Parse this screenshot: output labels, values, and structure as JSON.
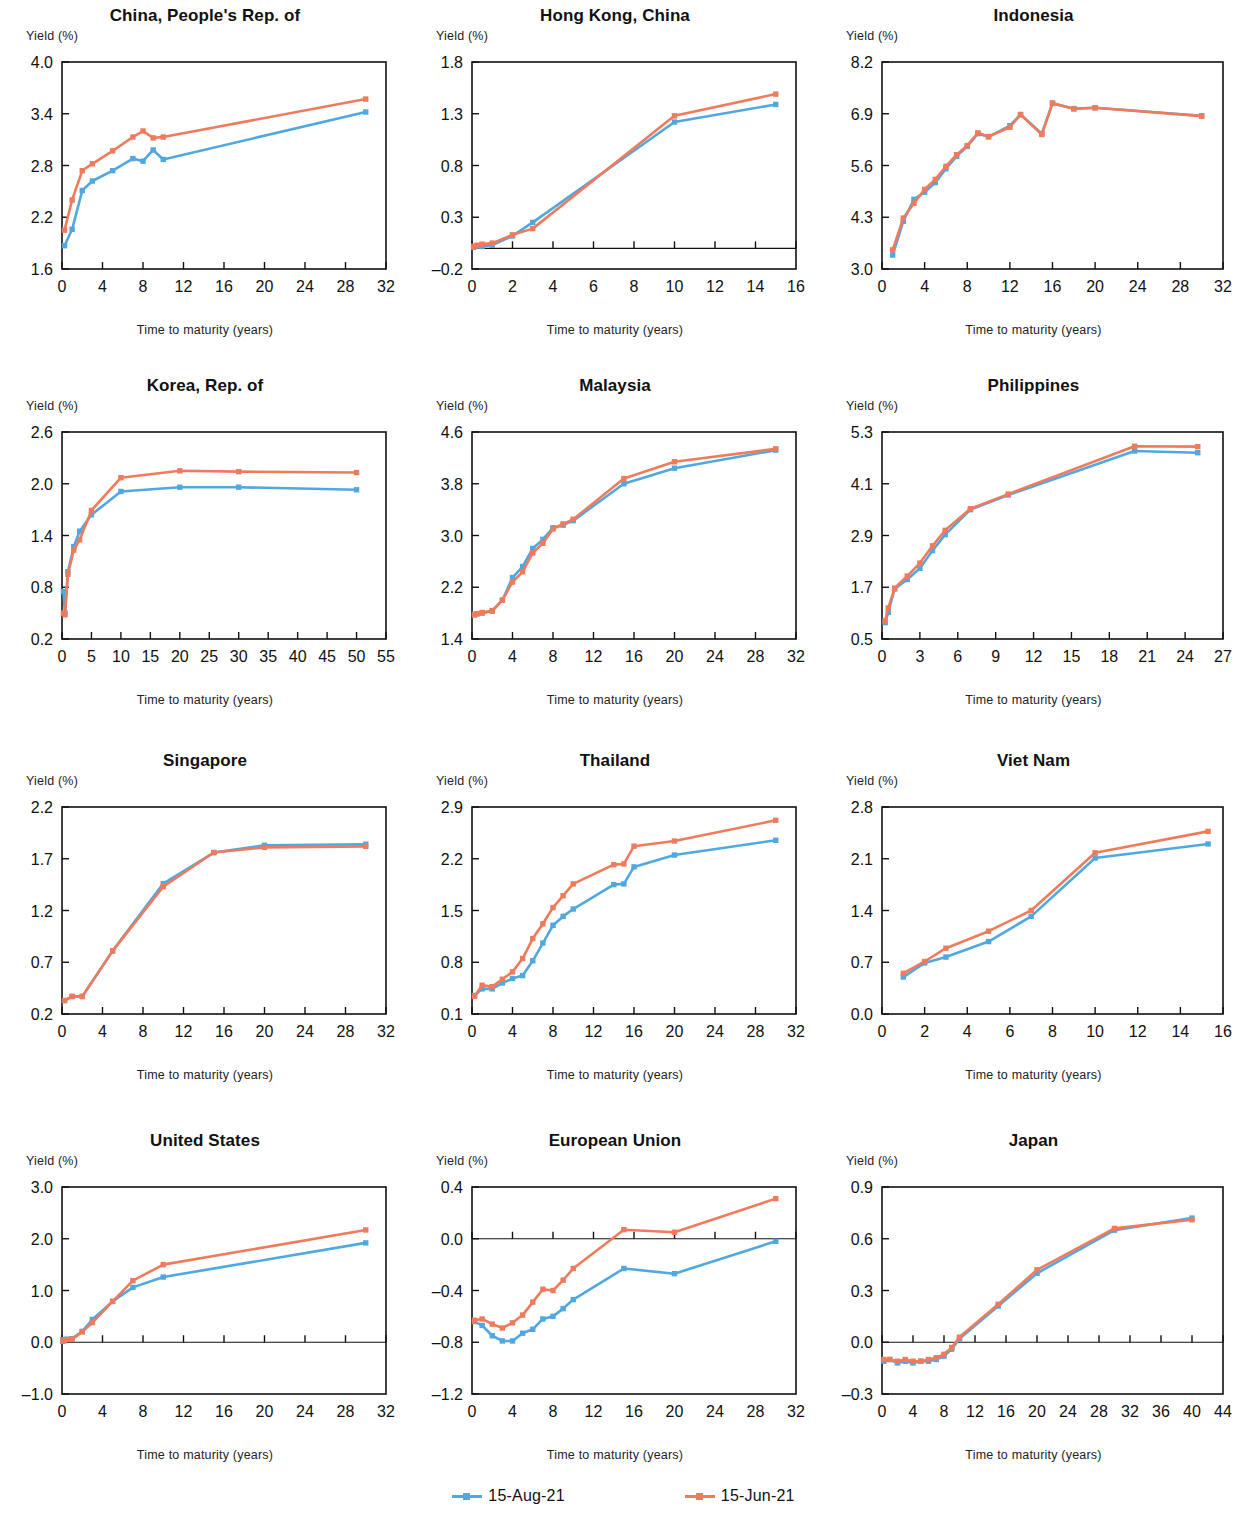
{
  "figure": {
    "axis_title_y": "Yield (%)",
    "axis_title_x": "Time to maturity (years)",
    "colors": {
      "series_aug": "#4FA8E0",
      "series_jun": "#F07B5C",
      "axis": "#111111"
    }
  },
  "legend": {
    "position": "bottom-center",
    "entries": [
      {
        "label": "15-Aug-21",
        "color": "#4FA8E0"
      },
      {
        "label": "15-Jun-21",
        "color": "#F07B5C"
      }
    ]
  },
  "chart_data": [
    {
      "type": "line",
      "title": "China, People's Rep. of",
      "xlabel": "Time to maturity (years)",
      "ylabel": "Yield (%)",
      "xlim": [
        0,
        32
      ],
      "ylim": [
        1.6,
        4.0
      ],
      "xticks": [
        0,
        4,
        8,
        12,
        16,
        20,
        24,
        28,
        32
      ],
      "yticks": [
        1.6,
        2.2,
        2.8,
        3.4,
        4.0
      ],
      "grid": false,
      "series": [
        {
          "name": "15-Aug-21",
          "color": "#4FA8E0",
          "x": [
            0.25,
            1,
            2,
            3,
            5,
            7,
            8,
            9,
            10,
            30
          ],
          "values": [
            1.87,
            2.06,
            2.51,
            2.62,
            2.74,
            2.88,
            2.85,
            2.98,
            2.87,
            3.42
          ]
        },
        {
          "name": "15-Jun-21",
          "color": "#F07B5C",
          "x": [
            0.25,
            1,
            2,
            3,
            5,
            7,
            8,
            9,
            10,
            30
          ],
          "values": [
            2.05,
            2.4,
            2.74,
            2.82,
            2.97,
            3.13,
            3.2,
            3.12,
            3.13,
            3.57
          ]
        }
      ]
    },
    {
      "type": "line",
      "title": "Hong Kong, China",
      "xlabel": "Time to maturity (years)",
      "ylabel": "Yield (%)",
      "xlim": [
        0,
        16
      ],
      "ylim": [
        -0.2,
        1.8
      ],
      "xticks": [
        0,
        2,
        4,
        6,
        8,
        10,
        12,
        14,
        16
      ],
      "yticks": [
        -0.2,
        0.3,
        0.8,
        1.3,
        1.8
      ],
      "grid": false,
      "series": [
        {
          "name": "15-Aug-21",
          "color": "#4FA8E0",
          "x": [
            0.08,
            0.25,
            0.5,
            1,
            2,
            3,
            10,
            15
          ],
          "values": [
            0.01,
            0.02,
            0.02,
            0.03,
            0.12,
            0.25,
            1.22,
            1.39
          ]
        },
        {
          "name": "15-Jun-21",
          "color": "#F07B5C",
          "x": [
            0.08,
            0.25,
            0.5,
            1,
            2,
            3,
            10,
            15
          ],
          "values": [
            0.02,
            0.03,
            0.04,
            0.05,
            0.13,
            0.19,
            1.28,
            1.49
          ]
        }
      ]
    },
    {
      "type": "line",
      "title": "Indonesia",
      "xlabel": "Time to maturity (years)",
      "ylabel": "Yield (%)",
      "xlim": [
        0,
        32
      ],
      "ylim": [
        3.0,
        8.2
      ],
      "xticks": [
        0,
        4,
        8,
        12,
        16,
        20,
        24,
        28,
        32
      ],
      "yticks": [
        3.0,
        4.3,
        5.6,
        6.9,
        8.2
      ],
      "grid": false,
      "series": [
        {
          "name": "15-Aug-21",
          "color": "#4FA8E0",
          "x": [
            1,
            2,
            3,
            4,
            5,
            6,
            7,
            8,
            9,
            10,
            12,
            13,
            15,
            16,
            18,
            20,
            30
          ],
          "values": [
            3.35,
            4.2,
            4.75,
            4.93,
            5.17,
            5.52,
            5.83,
            6.08,
            6.4,
            6.32,
            6.6,
            6.88,
            6.4,
            7.16,
            7.03,
            7.05,
            6.85
          ]
        },
        {
          "name": "15-Jun-21",
          "color": "#F07B5C",
          "x": [
            1,
            2,
            3,
            4,
            5,
            6,
            7,
            8,
            9,
            10,
            12,
            13,
            15,
            16,
            18,
            20,
            30
          ],
          "values": [
            3.48,
            4.28,
            4.65,
            5.0,
            5.25,
            5.58,
            5.87,
            6.1,
            6.42,
            6.33,
            6.56,
            6.88,
            6.38,
            7.17,
            7.02,
            7.05,
            6.84
          ]
        }
      ]
    },
    {
      "type": "line",
      "title": "Korea, Rep. of",
      "xlabel": "Time to maturity (years)",
      "ylabel": "Yield (%)",
      "xlim": [
        0,
        55
      ],
      "ylim": [
        0.2,
        2.6
      ],
      "xticks": [
        0,
        5,
        10,
        15,
        20,
        25,
        30,
        35,
        40,
        45,
        50,
        55
      ],
      "yticks": [
        0.2,
        0.8,
        1.4,
        2.0,
        2.6
      ],
      "grid": false,
      "series": [
        {
          "name": "15-Aug-21",
          "color": "#4FA8E0",
          "x": [
            0.25,
            0.5,
            1,
            2,
            3,
            5,
            10,
            20,
            30,
            50
          ],
          "values": [
            0.75,
            0.5,
            0.98,
            1.27,
            1.45,
            1.64,
            1.91,
            1.96,
            1.96,
            1.93
          ]
        },
        {
          "name": "15-Jun-21",
          "color": "#F07B5C",
          "x": [
            0.25,
            0.5,
            1,
            2,
            3,
            5,
            10,
            20,
            30,
            50
          ],
          "values": [
            0.5,
            0.48,
            0.95,
            1.23,
            1.35,
            1.69,
            2.07,
            2.15,
            2.14,
            2.13
          ]
        }
      ]
    },
    {
      "type": "line",
      "title": "Malaysia",
      "xlabel": "Time to maturity (years)",
      "ylabel": "Yield (%)",
      "xlim": [
        0,
        32
      ],
      "ylim": [
        1.4,
        4.6
      ],
      "xticks": [
        0,
        4,
        8,
        12,
        16,
        20,
        24,
        28,
        32
      ],
      "yticks": [
        1.4,
        2.2,
        3.0,
        3.8,
        4.6
      ],
      "grid": false,
      "series": [
        {
          "name": "15-Aug-21",
          "color": "#4FA8E0",
          "x": [
            0.25,
            0.5,
            1,
            2,
            3,
            4,
            5,
            6,
            7,
            8,
            9,
            10,
            15,
            20,
            30
          ],
          "values": [
            1.78,
            1.79,
            1.8,
            1.83,
            2.0,
            2.35,
            2.52,
            2.8,
            2.94,
            3.12,
            3.16,
            3.23,
            3.8,
            4.04,
            4.32
          ]
        },
        {
          "name": "15-Jun-21",
          "color": "#F07B5C",
          "x": [
            0.25,
            0.5,
            1,
            2,
            3,
            4,
            5,
            6,
            7,
            8,
            9,
            10,
            15,
            20,
            30
          ],
          "values": [
            1.77,
            1.79,
            1.81,
            1.84,
            2.0,
            2.28,
            2.44,
            2.73,
            2.88,
            3.1,
            3.18,
            3.25,
            3.88,
            4.14,
            4.34
          ]
        }
      ]
    },
    {
      "type": "line",
      "title": "Philippines",
      "xlabel": "Time to maturity (years)",
      "ylabel": "Yield (%)",
      "xlim": [
        0,
        27
      ],
      "ylim": [
        0.5,
        5.3
      ],
      "xticks": [
        0,
        3,
        6,
        9,
        12,
        15,
        18,
        21,
        24,
        27
      ],
      "yticks": [
        0.5,
        1.7,
        2.9,
        4.1,
        5.3
      ],
      "grid": false,
      "series": [
        {
          "name": "15-Aug-21",
          "color": "#4FA8E0",
          "x": [
            0.25,
            0.5,
            1,
            2,
            3,
            4,
            5,
            7,
            10,
            20,
            25
          ],
          "values": [
            0.88,
            1.12,
            1.66,
            1.88,
            2.14,
            2.55,
            2.92,
            3.5,
            3.84,
            4.86,
            4.82
          ]
        },
        {
          "name": "15-Jun-21",
          "color": "#F07B5C",
          "x": [
            0.25,
            0.5,
            1,
            2,
            3,
            4,
            5,
            7,
            10,
            20,
            25
          ],
          "values": [
            0.92,
            1.22,
            1.68,
            1.96,
            2.26,
            2.66,
            3.02,
            3.52,
            3.86,
            4.97,
            4.96
          ]
        }
      ]
    },
    {
      "type": "line",
      "title": "Singapore",
      "xlabel": "Time to maturity (years)",
      "ylabel": "Yield (%)",
      "xlim": [
        0,
        32
      ],
      "ylim": [
        0.2,
        2.2
      ],
      "xticks": [
        0,
        4,
        8,
        12,
        16,
        20,
        24,
        28,
        32
      ],
      "yticks": [
        0.2,
        0.7,
        1.2,
        1.7,
        2.2
      ],
      "grid": false,
      "series": [
        {
          "name": "15-Aug-21",
          "color": "#4FA8E0",
          "x": [
            0.25,
            1,
            2,
            5,
            10,
            15,
            20,
            30
          ],
          "values": [
            0.33,
            0.37,
            0.37,
            0.81,
            1.46,
            1.76,
            1.83,
            1.84
          ]
        },
        {
          "name": "15-Jun-21",
          "color": "#F07B5C",
          "x": [
            0.25,
            1,
            2,
            5,
            10,
            15,
            20,
            30
          ],
          "values": [
            0.33,
            0.37,
            0.37,
            0.81,
            1.43,
            1.76,
            1.81,
            1.82
          ]
        }
      ]
    },
    {
      "type": "line",
      "title": "Thailand",
      "xlabel": "Time to maturity (years)",
      "ylabel": "Yield (%)",
      "xlim": [
        0,
        32
      ],
      "ylim": [
        0.1,
        2.9
      ],
      "xticks": [
        0,
        4,
        8,
        12,
        16,
        20,
        24,
        28,
        32
      ],
      "yticks": [
        0.1,
        0.8,
        1.5,
        2.2,
        2.9
      ],
      "grid": false,
      "series": [
        {
          "name": "15-Aug-21",
          "color": "#4FA8E0",
          "x": [
            0.25,
            1,
            2,
            3,
            4,
            5,
            6,
            7,
            8,
            9,
            10,
            14,
            15,
            16,
            20,
            30
          ],
          "values": [
            0.35,
            0.44,
            0.44,
            0.52,
            0.58,
            0.62,
            0.82,
            1.06,
            1.3,
            1.42,
            1.52,
            1.85,
            1.86,
            2.09,
            2.25,
            2.45
          ]
        },
        {
          "name": "15-Jun-21",
          "color": "#F07B5C",
          "x": [
            0.25,
            1,
            2,
            3,
            4,
            5,
            6,
            7,
            8,
            9,
            10,
            14,
            15,
            16,
            20,
            30
          ],
          "values": [
            0.34,
            0.49,
            0.47,
            0.57,
            0.67,
            0.85,
            1.12,
            1.32,
            1.54,
            1.7,
            1.86,
            2.12,
            2.13,
            2.37,
            2.44,
            2.72
          ]
        }
      ]
    },
    {
      "type": "line",
      "title": "Viet Nam",
      "xlabel": "Time to maturity (years)",
      "ylabel": "Yield (%)",
      "xlim": [
        0,
        16
      ],
      "ylim": [
        0.0,
        2.8
      ],
      "xticks": [
        0,
        2,
        4,
        6,
        8,
        10,
        12,
        14,
        16
      ],
      "yticks": [
        0.0,
        0.7,
        1.4,
        2.1,
        2.8
      ],
      "grid": false,
      "series": [
        {
          "name": "15-Aug-21",
          "color": "#4FA8E0",
          "x": [
            1,
            2,
            3,
            5,
            7,
            10,
            15.3
          ],
          "values": [
            0.5,
            0.69,
            0.77,
            0.98,
            1.32,
            2.11,
            2.3
          ]
        },
        {
          "name": "15-Jun-21",
          "color": "#F07B5C",
          "x": [
            1,
            2,
            3,
            5,
            7,
            10,
            15.3
          ],
          "values": [
            0.55,
            0.71,
            0.89,
            1.12,
            1.4,
            2.18,
            2.47
          ]
        }
      ]
    },
    {
      "type": "line",
      "title": "United States",
      "xlabel": "Time to maturity (years)",
      "ylabel": "Yield (%)",
      "xlim": [
        0,
        32
      ],
      "ylim": [
        -1.0,
        3.0
      ],
      "xticks": [
        0,
        4,
        8,
        12,
        16,
        20,
        24,
        28,
        32
      ],
      "yticks": [
        -1.0,
        0.0,
        1.0,
        2.0,
        3.0
      ],
      "grid": false,
      "series": [
        {
          "name": "15-Aug-21",
          "color": "#4FA8E0",
          "x": [
            0.08,
            0.25,
            0.5,
            1,
            2,
            3,
            5,
            7,
            10,
            30
          ],
          "values": [
            0.05,
            0.05,
            0.06,
            0.07,
            0.21,
            0.44,
            0.79,
            1.06,
            1.26,
            1.92
          ]
        },
        {
          "name": "15-Jun-21",
          "color": "#F07B5C",
          "x": [
            0.08,
            0.25,
            0.5,
            1,
            2,
            3,
            5,
            7,
            10,
            30
          ],
          "values": [
            0.02,
            0.03,
            0.05,
            0.06,
            0.2,
            0.38,
            0.79,
            1.19,
            1.5,
            2.17
          ]
        }
      ]
    },
    {
      "type": "line",
      "title": "European Union",
      "xlabel": "Time to maturity (years)",
      "ylabel": "Yield (%)",
      "xlim": [
        0,
        32
      ],
      "ylim": [
        -1.2,
        0.4
      ],
      "xticks": [
        0,
        4,
        8,
        12,
        16,
        20,
        24,
        28,
        32
      ],
      "yticks": [
        -1.2,
        -0.8,
        -0.4,
        0.0,
        0.4
      ],
      "grid": false,
      "series": [
        {
          "name": "15-Aug-21",
          "color": "#4FA8E0",
          "x": [
            0.25,
            1,
            2,
            3,
            4,
            5,
            6,
            7,
            8,
            9,
            10,
            15,
            20,
            30
          ],
          "values": [
            -0.64,
            -0.67,
            -0.75,
            -0.79,
            -0.79,
            -0.73,
            -0.7,
            -0.62,
            -0.6,
            -0.54,
            -0.47,
            -0.23,
            -0.27,
            -0.02
          ]
        },
        {
          "name": "15-Jun-21",
          "color": "#F07B5C",
          "x": [
            0.25,
            1,
            2,
            3,
            4,
            5,
            6,
            7,
            8,
            9,
            10,
            15,
            20,
            30
          ],
          "values": [
            -0.63,
            -0.62,
            -0.66,
            -0.69,
            -0.65,
            -0.59,
            -0.49,
            -0.39,
            -0.4,
            -0.32,
            -0.23,
            0.07,
            0.05,
            0.31
          ]
        }
      ]
    },
    {
      "type": "line",
      "title": "Japan",
      "xlabel": "Time to maturity (years)",
      "ylabel": "Yield (%)",
      "xlim": [
        0,
        44
      ],
      "ylim": [
        -0.3,
        0.9
      ],
      "xticks": [
        0,
        4,
        8,
        12,
        16,
        20,
        24,
        28,
        32,
        36,
        40,
        44
      ],
      "yticks": [
        -0.3,
        0.0,
        0.3,
        0.6,
        0.9
      ],
      "grid": false,
      "series": [
        {
          "name": "15-Aug-21",
          "color": "#4FA8E0",
          "x": [
            0.25,
            1,
            2,
            3,
            4,
            5,
            6,
            7,
            8,
            9,
            10,
            15,
            20,
            30,
            40
          ],
          "values": [
            -0.11,
            -0.1,
            -0.12,
            -0.11,
            -0.12,
            -0.11,
            -0.11,
            -0.1,
            -0.08,
            -0.04,
            0.02,
            0.21,
            0.4,
            0.65,
            0.72
          ]
        },
        {
          "name": "15-Jun-21",
          "color": "#F07B5C",
          "x": [
            0.25,
            1,
            2,
            3,
            4,
            5,
            6,
            7,
            8,
            9,
            10,
            15,
            20,
            30,
            40
          ],
          "values": [
            -0.1,
            -0.1,
            -0.11,
            -0.1,
            -0.11,
            -0.11,
            -0.1,
            -0.09,
            -0.07,
            -0.03,
            0.03,
            0.22,
            0.42,
            0.66,
            0.71
          ]
        }
      ]
    }
  ]
}
